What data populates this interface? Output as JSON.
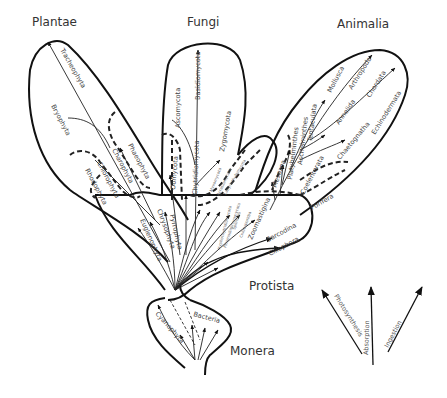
{
  "kingdoms": {
    "plantae": "Plantae",
    "fungi": "Fungi",
    "animalia": "Animalia",
    "protista": "Protista",
    "monera": "Monera"
  },
  "plantae_phyla": {
    "tracheophyta": "Tracheophyta",
    "bryophyta": "Bryophyta",
    "phaeophyta": "Phaeophyta",
    "charophyta": "Charophyta",
    "chlorophyta": "Chlorophyta",
    "rhodophyta": "Rhodophyta"
  },
  "fungi_phyla": {
    "basidiomycota": "Basidiomycota",
    "ascomycota": "Ascomycota",
    "zygomycota": "Zygomycota",
    "oomycota": "Oomycota",
    "chytridiomycota": "Chytridiomycota"
  },
  "animalia_phyla": {
    "mollusca": "Mollusca",
    "arthropoda": "Arthropoda",
    "chordata": "Chordata",
    "annelida": "Annelida",
    "echinodermata": "Echinodermata",
    "tentaculata": "Tentaculata",
    "aschelminthes": "Aschelminthes",
    "platyhelminthes": "Platyhelminthes",
    "chaetognatha": "Chaetognatha",
    "mesozoa": "Mesozoa",
    "coelenterata": "Coelenterata",
    "porifera": "Porifera"
  },
  "protista_phyla": {
    "chrysophyta": "Chrysophyta",
    "pyrrophyta": "Pyrrophyta",
    "euglenophyta": "Euglenophyta",
    "myxomycota": "Myxomycota",
    "acrasiomycota": "Acrasiomycota",
    "labyrinthulomycota": "Labyrinthulomycota",
    "hyphochytridiomycota": "Hyphochytridiomycota",
    "plasmodiophoromycota": "Plasmodiophoromycota",
    "sporozoa": "Sporozoa",
    "cnidosporidia": "Cnidosporidia",
    "zoomastigina": "Zoomastigina",
    "sarcodina": "Sarcodina",
    "ciliophora": "Ciliophora"
  },
  "monera_phyla": {
    "cyanophyta": "Cyanophyta",
    "bacteria": "Bacteria"
  },
  "nutrition_modes": {
    "photosynthesis": "Photosynthesis",
    "absorption": "Absorption",
    "ingestion": "Ingestion"
  }
}
